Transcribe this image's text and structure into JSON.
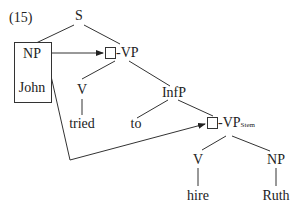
{
  "example_number": "(15)",
  "nodes": {
    "S": "S",
    "NP_subject": "NP",
    "John": "John",
    "VP_main": "-VP",
    "V_tried": "V",
    "tried": "tried",
    "InfP": "InfP",
    "to": "to",
    "VP_stem": "-VP",
    "VP_stem_subscript": "Stem",
    "V_hire": "V",
    "hire": "hire",
    "NP_object": "NP",
    "Ruth": "Ruth"
  },
  "arrows": [
    {
      "from": "NP_subject",
      "to": "VP_main"
    },
    {
      "from": "NP_subject",
      "to": "VP_stem"
    }
  ]
}
